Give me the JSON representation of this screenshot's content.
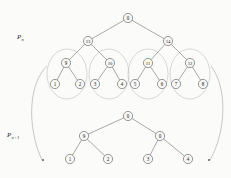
{
  "figure": {
    "background_color": "#fbfbfa",
    "node_fill": "#f7f7f6",
    "node_stroke": "#5e5e5e",
    "edge_color": "#6f6f6f",
    "ellipse_color": "#b9b9b9",
    "arc_color": "#9a9a9a"
  },
  "labels": {
    "upper_tier": "P",
    "upper_tier_sub": "n",
    "lower_tier": "P",
    "lower_tier_sub": "n+1"
  },
  "upper_tree": {
    "name": "P_n",
    "root": {
      "id": "u-root",
      "label": "0",
      "x": 128,
      "y": 18
    },
    "level2": [
      {
        "id": "u-13",
        "label": "13",
        "x": 88,
        "y": 41
      },
      {
        "id": "u-14",
        "label": "14",
        "x": 168,
        "y": 41
      }
    ],
    "level3": [
      {
        "id": "u-9",
        "label": "9",
        "x": 66,
        "y": 63
      },
      {
        "id": "u-10",
        "label": "10",
        "x": 110,
        "y": 63
      },
      {
        "id": "u-11",
        "label": "11",
        "x": 148,
        "y": 63
      },
      {
        "id": "u-12",
        "label": "12",
        "x": 190,
        "y": 63
      }
    ],
    "leaves": [
      {
        "id": "u-l1",
        "label": "1",
        "x": 55,
        "y": 84
      },
      {
        "id": "u-l2",
        "label": "2",
        "x": 80,
        "y": 84
      },
      {
        "id": "u-l3",
        "label": "3",
        "x": 95,
        "y": 84
      },
      {
        "id": "u-l4",
        "label": "4",
        "x": 122,
        "y": 84
      },
      {
        "id": "u-l5",
        "label": "5",
        "x": 135,
        "y": 84
      },
      {
        "id": "u-l6",
        "label": "6",
        "x": 162,
        "y": 84
      },
      {
        "id": "u-l7",
        "label": "7",
        "x": 176,
        "y": 84
      },
      {
        "id": "u-l8",
        "label": "8",
        "x": 203,
        "y": 84
      }
    ],
    "edges": [
      {
        "from": "u-root",
        "to": "u-13"
      },
      {
        "from": "u-root",
        "to": "u-14"
      },
      {
        "from": "u-13",
        "to": "u-9"
      },
      {
        "from": "u-13",
        "to": "u-10"
      },
      {
        "from": "u-14",
        "to": "u-11"
      },
      {
        "from": "u-14",
        "to": "u-12"
      },
      {
        "from": "u-9",
        "to": "u-l1"
      },
      {
        "from": "u-9",
        "to": "u-l2"
      },
      {
        "from": "u-10",
        "to": "u-l3"
      },
      {
        "from": "u-10",
        "to": "u-l4"
      },
      {
        "from": "u-11",
        "to": "u-l5"
      },
      {
        "from": "u-11",
        "to": "u-l6"
      },
      {
        "from": "u-12",
        "to": "u-l7"
      },
      {
        "from": "u-12",
        "to": "u-l8"
      }
    ],
    "clusters": [
      {
        "name": "cluster-9",
        "cx": 67,
        "cy": 74,
        "rx": 20,
        "ry": 25
      },
      {
        "name": "cluster-10",
        "cx": 109,
        "cy": 74,
        "rx": 20,
        "ry": 25
      },
      {
        "name": "cluster-11",
        "cx": 148,
        "cy": 74,
        "rx": 20,
        "ry": 25
      },
      {
        "name": "cluster-12",
        "cx": 190,
        "cy": 74,
        "rx": 20,
        "ry": 25
      }
    ]
  },
  "lower_tree": {
    "name": "P_n+1",
    "root": {
      "id": "d-root",
      "label": "0",
      "x": 128,
      "y": 116
    },
    "level2": [
      {
        "id": "d-9",
        "label": "9",
        "x": 84,
        "y": 136
      },
      {
        "id": "d-10",
        "label": "0",
        "x": 160,
        "y": 136
      }
    ],
    "leaves": [
      {
        "id": "d-l1",
        "label": "1",
        "x": 70,
        "y": 159
      },
      {
        "id": "d-l2",
        "label": "2",
        "x": 108,
        "y": 159
      },
      {
        "id": "d-l3",
        "label": "3",
        "x": 148,
        "y": 159
      },
      {
        "id": "d-l4",
        "label": "4",
        "x": 188,
        "y": 159
      }
    ],
    "edges": [
      {
        "from": "d-root",
        "to": "d-9"
      },
      {
        "from": "d-root",
        "to": "d-10"
      },
      {
        "from": "d-9",
        "to": "d-l1"
      },
      {
        "from": "d-9",
        "to": "d-l2"
      },
      {
        "from": "d-10",
        "to": "d-l3"
      },
      {
        "from": "d-10",
        "to": "d-l4"
      }
    ]
  },
  "mapping_arcs": [
    {
      "name": "left-contraction-arc",
      "path": "M 47 66 C 28 84, 27 128, 42 160",
      "arrow_x": 43,
      "arrow_y": 160
    },
    {
      "name": "right-contraction-arc",
      "path": "M 211 66 C 228 88, 226 132, 210 160",
      "arrow_x": 209,
      "arrow_y": 160
    }
  ]
}
